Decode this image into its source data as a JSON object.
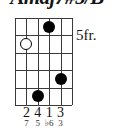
{
  "chord": {
    "title": "Amaj7#5/B",
    "fret_position_label": "5fr.",
    "strings": 6,
    "frets": 5,
    "markers": [
      {
        "name": "open-marker-string2-fret2",
        "string": 2,
        "fret": 2,
        "type": "open"
      },
      {
        "name": "filled-marker-string4-fret1",
        "string": 4,
        "fret": 1,
        "type": "filled"
      },
      {
        "name": "filled-marker-string5-fret4",
        "string": 5,
        "fret": 4,
        "type": "filled"
      },
      {
        "name": "filled-marker-string3-fret5",
        "string": 3,
        "fret": 5,
        "type": "filled"
      }
    ],
    "fingering": [
      {
        "string": 2,
        "label": "2"
      },
      {
        "string": 3,
        "label": "4"
      },
      {
        "string": 4,
        "label": "1"
      },
      {
        "string": 5,
        "label": "3"
      }
    ],
    "intervals": [
      {
        "string": 2,
        "label": "7"
      },
      {
        "string": 3,
        "label": "5"
      },
      {
        "string": 4,
        "label": "♭6"
      },
      {
        "string": 5,
        "label": "3"
      }
    ],
    "colors": {
      "grid": "#3a3a3a",
      "marker": "#000000",
      "text": "#141414",
      "background": "#ffffff"
    }
  }
}
